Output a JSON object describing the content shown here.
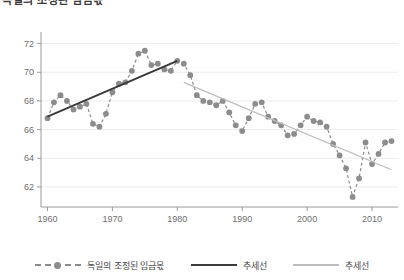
{
  "title": "독일의 조정된 임금몫",
  "legend": [
    {
      "label": "독일의 조정된 임금몫",
      "style": "dashed-marker",
      "color": "#8c8c8c"
    },
    {
      "label": "추세선",
      "style": "solid",
      "color": "#3a3a3a"
    },
    {
      "label": "추세선",
      "style": "solid",
      "color": "#bdbdbd"
    }
  ],
  "chart_data": {
    "type": "line",
    "title": "독일의 조정된 임금몫",
    "xlabel": "연도",
    "ylabel": "",
    "xlim": [
      1959,
      2014
    ],
    "ylim": [
      60.6,
      72.6
    ],
    "xticks": [
      1960,
      1970,
      1980,
      1990,
      2000,
      2010
    ],
    "yticks": [
      62,
      64,
      66,
      68,
      70,
      72
    ],
    "grid": true,
    "legend_position": "bottom",
    "series": [
      {
        "name": "독일의 조정된 임금몫",
        "style": "dashed-marker",
        "color": "#8c8c8c",
        "x": [
          1960,
          1961,
          1962,
          1963,
          1964,
          1965,
          1966,
          1967,
          1968,
          1969,
          1970,
          1971,
          1972,
          1973,
          1974,
          1975,
          1976,
          1977,
          1978,
          1979,
          1980,
          1981,
          1982,
          1983,
          1984,
          1985,
          1986,
          1987,
          1988,
          1989,
          1990,
          1991,
          1992,
          1993,
          1994,
          1995,
          1996,
          1997,
          1998,
          1999,
          2000,
          2001,
          2002,
          2003,
          2004,
          2005,
          2006,
          2007,
          2008,
          2009,
          2010,
          2011,
          2012,
          2013
        ],
        "y": [
          66.8,
          67.9,
          68.4,
          68.0,
          67.4,
          67.6,
          67.8,
          66.4,
          66.2,
          67.1,
          68.6,
          69.2,
          69.3,
          70.1,
          71.3,
          71.5,
          70.5,
          70.6,
          70.2,
          70.1,
          70.8,
          70.6,
          69.8,
          68.4,
          68.0,
          67.9,
          67.7,
          68.0,
          67.2,
          66.3,
          65.9,
          66.8,
          67.8,
          67.9,
          66.9,
          66.6,
          66.3,
          65.6,
          65.7,
          66.3,
          66.9,
          66.6,
          66.5,
          66.2,
          65.0,
          64.2,
          63.3,
          61.3,
          62.6,
          65.1,
          63.6,
          64.3,
          65.1,
          65.2
        ]
      },
      {
        "name": "추세선",
        "style": "solid",
        "color": "#3a3a3a",
        "fit_range": [
          1960,
          1980
        ],
        "endpoints": [
          {
            "x": 1960,
            "y": 66.9
          },
          {
            "x": 1980,
            "y": 70.8
          }
        ]
      },
      {
        "name": "추세선",
        "style": "solid",
        "color": "#bdbdbd",
        "fit_range": [
          1981,
          2013
        ],
        "endpoints": [
          {
            "x": 1981,
            "y": 69.3
          },
          {
            "x": 2013,
            "y": 63.2
          }
        ]
      }
    ]
  }
}
